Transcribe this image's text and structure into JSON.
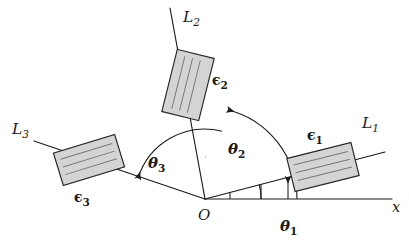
{
  "figure": {
    "background_color": "#ffffff",
    "stroke_color": "#1b1b1b",
    "slab_fill_color": "#d4d4d4",
    "slab_hatch_color": "#787878"
  },
  "origin": {
    "label": "O",
    "x": 205,
    "y": 199
  },
  "axis": {
    "label": "x",
    "start_x": 205,
    "start_y": 199,
    "end_x": 392,
    "end_y": 199
  },
  "rays": [
    {
      "id": "L1",
      "label": "L",
      "subscript": "1",
      "angle_deg": 14,
      "label_x": 362,
      "label_y": 128,
      "tip_x": 385,
      "tip_y": 152
    },
    {
      "id": "L2",
      "label": "L",
      "subscript": "2",
      "angle_deg": 76,
      "label_x": 183,
      "label_y": 22,
      "tip_x": 170,
      "tip_y": 8
    },
    {
      "id": "L3",
      "label": "L",
      "subscript": "3",
      "angle_deg": 163,
      "label_x": 12,
      "label_y": 134,
      "tip_x": 34,
      "tip_y": 141
    }
  ],
  "angles": [
    {
      "id": "theta1",
      "label": "θ",
      "subscript": "1",
      "symbol": "θ₁",
      "from_deg": 0,
      "to_deg": 14,
      "radius": 56,
      "label_x": 286,
      "label_y": 228,
      "measured_between": "x-axis and L1"
    },
    {
      "id": "theta2",
      "label": "θ",
      "subscript": "2",
      "symbol": "θ₂",
      "from_deg": 0,
      "to_deg": 76,
      "radius": 92,
      "label_x": 230,
      "label_y": 151,
      "measured_between": "x-axis and L2"
    },
    {
      "id": "theta3",
      "label": "θ",
      "subscript": "3",
      "symbol": "θ₃",
      "from_deg": 76,
      "to_deg": 163,
      "radius": 70,
      "label_x": 150,
      "label_y": 165,
      "measured_between": "L2 and L3"
    }
  ],
  "slabs": [
    {
      "id": "eps1",
      "label": "ϵ",
      "subscript": "1",
      "symbol": "ϵ₁",
      "on_ray": "L1",
      "center_x": 323,
      "center_y": 167,
      "width": 66,
      "height": 34,
      "rotation_deg": -14,
      "hatch_count": 3,
      "hatch_orientation": "along-long-axis",
      "label_x": 311,
      "label_y": 137
    },
    {
      "id": "eps2",
      "label": "ϵ",
      "subscript": "2",
      "symbol": "ϵ₂",
      "on_ray": "L2",
      "center_x": 188,
      "center_y": 85,
      "width": 64,
      "height": 38,
      "rotation_deg": -76,
      "hatch_count": 3,
      "hatch_orientation": "along-long-axis",
      "label_x": 214,
      "label_y": 81
    },
    {
      "id": "eps3",
      "label": "ϵ",
      "subscript": "3",
      "symbol": "ϵ₃",
      "on_ray": "L3",
      "center_x": 89,
      "center_y": 160,
      "width": 64,
      "height": 34,
      "rotation_deg": -17,
      "hatch_count": 3,
      "hatch_orientation": "along-long-axis",
      "label_x": 78,
      "label_y": 199
    }
  ]
}
